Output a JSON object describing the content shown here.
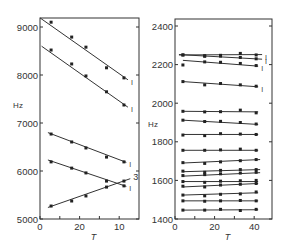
{
  "chart_data": [
    {
      "type": "scatter",
      "title": "",
      "xlabel": "T",
      "ylabel": "Hz",
      "xlim": [
        0,
        12.5
      ],
      "ylim": [
        5000,
        9200
      ],
      "xticks": [
        0,
        5,
        10
      ],
      "xtick_labels": [
        "0",
        "20",
        "10"
      ],
      "xticks_minor": [
        2.5,
        7.5
      ],
      "yticks": [
        5000,
        6000,
        7000,
        8000,
        9000
      ],
      "ytick_labels": [
        "5000",
        "6000",
        "7000",
        "8000",
        "9000"
      ],
      "grid": false,
      "frame": {
        "x0": 40,
        "x1": 139,
        "y_top": 18,
        "y_bottom": 219
      },
      "series": [
        {
          "name": "line-1a",
          "end_label": "I",
          "line": [
            [
              0,
              9190
            ],
            [
              11.1,
              7900
            ]
          ],
          "x": [
            1.4,
            4.0,
            5.8,
            8.4,
            10.6
          ],
          "y": [
            9100,
            8790,
            8580,
            8150,
            7940
          ]
        },
        {
          "name": "line-1b",
          "end_label": "I",
          "line": [
            [
              0.2,
              8600
            ],
            [
              11.1,
              7330
            ]
          ],
          "x": [
            1.4,
            4.0,
            5.8,
            8.4,
            10.6
          ],
          "y": [
            8520,
            8230,
            7980,
            7650,
            7375
          ]
        },
        {
          "name": "line-1c",
          "end_label": "I",
          "line": [
            [
              1.0,
              6800
            ],
            [
              10.9,
              6180
            ]
          ],
          "x": [
            1.4,
            4.0,
            5.8,
            8.4,
            10.6
          ],
          "y": [
            6770,
            6605,
            6480,
            6290,
            6190
          ]
        },
        {
          "name": "line-1d",
          "end_label": "I",
          "line": [
            [
              1.0,
              6230
            ],
            [
              10.9,
              5680
            ]
          ],
          "x": [
            1.4,
            4.0,
            5.8,
            8.4,
            10.6
          ],
          "y": [
            6190,
            6060,
            5960,
            5790,
            5690
          ]
        },
        {
          "name": "line-3",
          "end_label": "3",
          "line": [
            [
              1.0,
              5240
            ],
            [
              11.4,
              5840
            ]
          ],
          "x": [
            1.4,
            4.0,
            5.8,
            8.4,
            10.6
          ],
          "y": [
            5270,
            5375,
            5480,
            5665,
            5790
          ]
        }
      ]
    },
    {
      "type": "scatter",
      "title": "",
      "xlabel": "T",
      "ylabel": "Hz",
      "xlim": [
        0,
        49
      ],
      "ylim": [
        1400,
        2400
      ],
      "xticks": [
        0,
        20,
        40
      ],
      "xtick_labels": [
        "0",
        "20",
        "40"
      ],
      "xticks_minor": [
        10,
        30
      ],
      "yticks": [
        1400,
        1600,
        1800,
        2000,
        2200,
        2400
      ],
      "ytick_labels": [
        "1400",
        "1600",
        "1800",
        "2000",
        "2200",
        "2400"
      ],
      "grid": false,
      "frame": {
        "x0": 175,
        "x1": 272,
        "y_top": 19,
        "y_bottom": 219
      },
      "series": [
        {
          "name": "a",
          "end_label": "I",
          "line": [
            [
              2,
              2250
            ],
            [
              44,
              2252
            ]
          ],
          "x": [
            4,
            15,
            23,
            33,
            41
          ],
          "y": [
            2250,
            2246,
            2248,
            2258,
            2250
          ]
        },
        {
          "name": "b",
          "end_label": "I",
          "line": [
            [
              2,
              2252
            ],
            [
              44,
              2228
            ]
          ],
          "x": [
            4,
            15,
            23,
            33,
            41
          ],
          "y": [
            2250,
            2243,
            2244,
            2237,
            2230
          ]
        },
        {
          "name": "c",
          "end_label": "I",
          "line": [
            [
              4,
              2222
            ],
            [
              42,
              2192
            ]
          ],
          "x": [
            4,
            15,
            23,
            33,
            41
          ],
          "y": [
            2198,
            2214,
            2212,
            2206,
            2195
          ]
        },
        {
          "name": "d",
          "end_label": "I",
          "line": [
            [
              4,
              2112
            ],
            [
              42,
              2085
            ]
          ],
          "x": [
            4,
            15,
            23,
            33,
            41
          ],
          "y": [
            2112,
            2095,
            2102,
            2095,
            2088
          ]
        },
        {
          "name": "e",
          "end_label": "",
          "line": [
            [
              4,
              1958
            ],
            [
              42,
              1955
            ]
          ],
          "x": [
            4,
            15,
            23,
            33,
            41
          ],
          "y": [
            1958,
            1955,
            1956,
            1964,
            1950
          ]
        },
        {
          "name": "f",
          "end_label": "",
          "line": [
            [
              4,
              1912
            ],
            [
              42,
              1890
            ]
          ],
          "x": [
            4,
            15,
            23,
            33,
            41
          ],
          "y": [
            1912,
            1905,
            1906,
            1900,
            1892
          ]
        },
        {
          "name": "g",
          "end_label": "",
          "line": [
            [
              4,
              1838
            ],
            [
              42,
              1838
            ]
          ],
          "x": [
            4,
            15,
            23,
            33,
            41
          ],
          "y": [
            1835,
            1832,
            1842,
            1840,
            1838
          ]
        },
        {
          "name": "h",
          "end_label": "",
          "line": [
            [
              4,
              1756
            ],
            [
              42,
              1756
            ]
          ],
          "x": [
            4,
            15,
            23,
            33,
            41
          ],
          "y": [
            1756,
            1756,
            1758,
            1762,
            1756
          ]
        },
        {
          "name": "i",
          "end_label": "",
          "line": [
            [
              4,
              1690
            ],
            [
              43,
              1708
            ]
          ],
          "x": [
            4,
            15,
            23,
            33,
            41
          ],
          "y": [
            1692,
            1688,
            1696,
            1702,
            1708
          ]
        },
        {
          "name": "j",
          "end_label": "",
          "line": [
            [
              4,
              1645
            ],
            [
              43,
              1656
            ]
          ],
          "x": [
            4,
            15,
            23,
            33,
            41
          ],
          "y": [
            1648,
            1642,
            1652,
            1656,
            1656
          ]
        },
        {
          "name": "k",
          "end_label": "",
          "line": [
            [
              4,
              1622
            ],
            [
              43,
              1640
            ]
          ],
          "x": [
            4,
            15,
            23,
            33,
            41
          ],
          "y": [
            1625,
            1630,
            1634,
            1638,
            1642
          ]
        },
        {
          "name": "l",
          "end_label": "",
          "line": [
            [
              4,
              1594
            ],
            [
              42,
              1594
            ]
          ],
          "x": [
            4,
            15,
            23,
            33,
            41
          ],
          "y": [
            1594,
            1590,
            1596,
            1598,
            1600
          ]
        },
        {
          "name": "m",
          "end_label": "",
          "line": [
            [
              4,
              1566
            ],
            [
              42,
              1584
            ]
          ],
          "x": [
            4,
            15,
            23,
            33,
            41
          ],
          "y": [
            1570,
            1566,
            1576,
            1580,
            1584
          ]
        },
        {
          "name": "n",
          "end_label": "",
          "line": [
            [
              4,
              1524
            ],
            [
              42,
              1536
            ]
          ],
          "x": [
            4,
            15,
            23,
            33,
            41
          ],
          "y": [
            1524,
            1520,
            1528,
            1530,
            1540
          ]
        },
        {
          "name": "o",
          "end_label": "",
          "line": [
            [
              4,
              1494
            ],
            [
              42,
              1494
            ]
          ],
          "x": [
            4,
            15,
            23,
            33,
            41
          ],
          "y": [
            1494,
            1492,
            1494,
            1496,
            1494
          ]
        },
        {
          "name": "p",
          "end_label": "",
          "line": [
            [
              4,
              1446
            ],
            [
              42,
              1448
            ]
          ],
          "x": [
            4,
            15,
            23,
            33,
            41
          ],
          "y": [
            1446,
            1446,
            1450,
            1444,
            1450
          ]
        }
      ]
    }
  ]
}
